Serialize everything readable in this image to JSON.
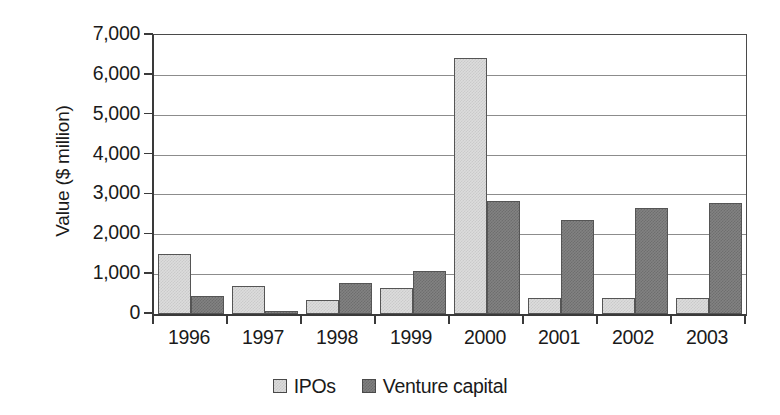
{
  "chart_data": {
    "type": "bar",
    "title": "",
    "subtitle": "",
    "xlabel": "",
    "ylabel": "Value ($ million)",
    "categories": [
      "1996",
      "1997",
      "1998",
      "1999",
      "2000",
      "2001",
      "2002",
      "2003"
    ],
    "series": [
      {
        "name": "IPOs",
        "color": "#dcdcdc",
        "values": [
          1500,
          700,
          340,
          650,
          6420,
          400,
          400,
          410
        ]
      },
      {
        "name": "Venture capital",
        "color": "#828282",
        "values": [
          460,
          70,
          780,
          1070,
          2830,
          2370,
          2670,
          2780
        ]
      }
    ],
    "ylim": [
      0,
      7000
    ],
    "ytick_step": 1000,
    "ytick_labels": [
      "7,000",
      "6,000",
      "5,000",
      "4,000",
      "3,000",
      "2,000",
      "1,000",
      "0"
    ],
    "ytick_values": [
      7000,
      6000,
      5000,
      4000,
      3000,
      2000,
      1000,
      0
    ],
    "grid": "horizontal",
    "legend_position": "bottom-center",
    "bar_mode": "grouped"
  }
}
